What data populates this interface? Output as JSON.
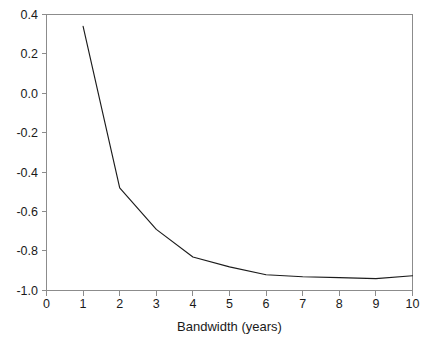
{
  "chart_data": {
    "type": "line",
    "title": "",
    "subtitle": "",
    "xlabel": "Bandwidth (years)",
    "ylabel": "",
    "xlim": [
      0,
      10
    ],
    "ylim": [
      -1.0,
      0.4
    ],
    "xticks": [
      0,
      1,
      2,
      3,
      4,
      5,
      6,
      7,
      8,
      9,
      10
    ],
    "xticklabels": [
      "0",
      "1",
      "2",
      "3",
      "4",
      "5",
      "6",
      "7",
      "8",
      "9",
      "10"
    ],
    "yticks": [
      0.4,
      0.2,
      0.0,
      -0.2,
      -0.4,
      -0.6,
      -0.8,
      -1.0
    ],
    "yticklabels": [
      "0.4",
      "0.2",
      "0.0",
      "-0.2",
      "-0.4",
      "-0.6",
      "-0.8",
      "-1.0"
    ],
    "grid": false,
    "legend": null,
    "legend_position": "none",
    "frame": "left-top-right-bottom",
    "series": [
      {
        "name": "score",
        "color": "#1c1c1c",
        "linewidth": 1.15,
        "x": [
          1,
          2,
          3,
          4,
          5,
          6,
          7,
          8,
          9,
          10
        ],
        "values": [
          0.34,
          -0.48,
          -0.69,
          -0.83,
          -0.88,
          -0.92,
          -0.93,
          -0.935,
          -0.94,
          -0.925
        ]
      }
    ],
    "annotations": []
  },
  "axes": {
    "x_axis_label": "Bandwidth (years)",
    "y_axis_label": "",
    "tick_color": "#8c8c8c",
    "text_color": "#1a1a1a",
    "line_color": "#1c1c1c",
    "background": "#ffffff"
  }
}
